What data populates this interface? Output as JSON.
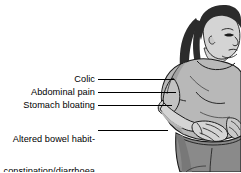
{
  "image": {
    "subject": "woman-hunched-abdominal-pain",
    "description": "Line drawing of a woman in a light grey top and darker grey shorts, hunched forward with her right hand pressed to her abdomen, long dark hair, head bowed.",
    "background_color": "#ffffff"
  },
  "palette": {
    "line": "#1a1a1a",
    "hair": "#2b2b2b",
    "skin": "#d4d4d4",
    "skin_shadow": "#b0b0b0",
    "top": "#b8b8b8",
    "top_shadow": "#a0a0a0",
    "shorts": "#8a8a8a",
    "shorts_shadow": "#787878",
    "leader_line": "#000000"
  },
  "callouts": [
    {
      "id": "colic",
      "label": "Colic",
      "lines": [
        "Colic"
      ],
      "leader": {
        "x1": 98,
        "y1": 79,
        "x2": 174,
        "y2": 79
      }
    },
    {
      "id": "abdominal-pain",
      "label": "Abdominal pain",
      "lines": [
        "Abdominal pain"
      ],
      "leader": {
        "x1": 98,
        "y1": 92,
        "x2": 176,
        "y2": 92
      }
    },
    {
      "id": "stomach-bloating",
      "label": "Stomach bloating",
      "lines": [
        "Stomach bloating"
      ],
      "leader": {
        "x1": 98,
        "y1": 105,
        "x2": 172,
        "y2": 105
      }
    },
    {
      "id": "altered-bowel-habit",
      "label": "Altered bowel habit-constipation/diarrhoea",
      "lines": [
        "Altered bowel habit-",
        "constipation/diarrhoea"
      ],
      "leader": {
        "x1": 98,
        "y1": 130,
        "x2": 168,
        "y2": 130
      }
    }
  ]
}
